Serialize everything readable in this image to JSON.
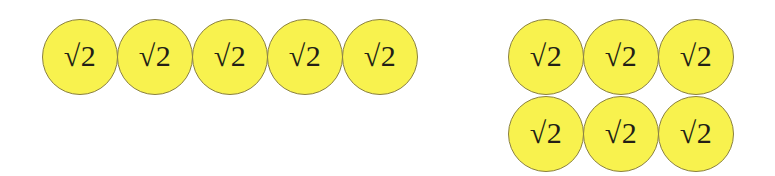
{
  "background_color": "#ffffff",
  "token": {
    "label": "√2",
    "fill_color": "#f8f24e",
    "border_color": "#8a8040",
    "text_color": "#231f16",
    "shape": "circle",
    "diameter_px": 76
  },
  "groups": [
    {
      "name": "left-group",
      "count": 5,
      "rows": 1,
      "columns": 5,
      "arrangement": "single-row",
      "tokens": [
        {
          "label": "√2"
        },
        {
          "label": "√2"
        },
        {
          "label": "√2"
        },
        {
          "label": "√2"
        },
        {
          "label": "√2"
        }
      ]
    },
    {
      "name": "right-group",
      "count": 6,
      "rows": 2,
      "columns": 3,
      "arrangement": "grid-3x2",
      "rows_data": [
        {
          "tokens": [
            {
              "label": "√2"
            },
            {
              "label": "√2"
            },
            {
              "label": "√2"
            }
          ]
        },
        {
          "tokens": [
            {
              "label": "√2"
            },
            {
              "label": "√2"
            },
            {
              "label": "√2"
            }
          ]
        }
      ]
    }
  ]
}
